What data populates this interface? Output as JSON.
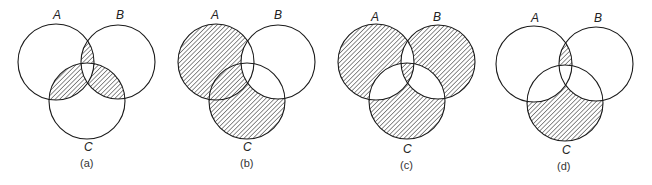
{
  "figure": {
    "panels": [
      {
        "id": "a",
        "caption": "(a)",
        "labels": {
          "A": "A",
          "B": "B",
          "C": "C"
        },
        "shaded_region": "(A∩B) ∪ (A∩C) ∪ (B∩C) − (A∩B∩C)"
      },
      {
        "id": "b",
        "caption": "(b)",
        "labels": {
          "A": "A",
          "B": "B",
          "C": "C"
        },
        "shaded_region": "(A ∪ C) − B"
      },
      {
        "id": "c",
        "caption": "(c)",
        "labels": {
          "A": "A",
          "B": "B",
          "C": "C"
        },
        "shaded_region": "A △ B △ C"
      },
      {
        "id": "d",
        "caption": "(d)",
        "labels": {
          "A": "A",
          "B": "B",
          "C": "C"
        },
        "shaded_region": "(A∩B − C) ∪ (C − A − B)"
      }
    ],
    "colors": {
      "stroke": "#1a1a1a",
      "hatch": "#333333",
      "background": "#ffffff"
    }
  }
}
